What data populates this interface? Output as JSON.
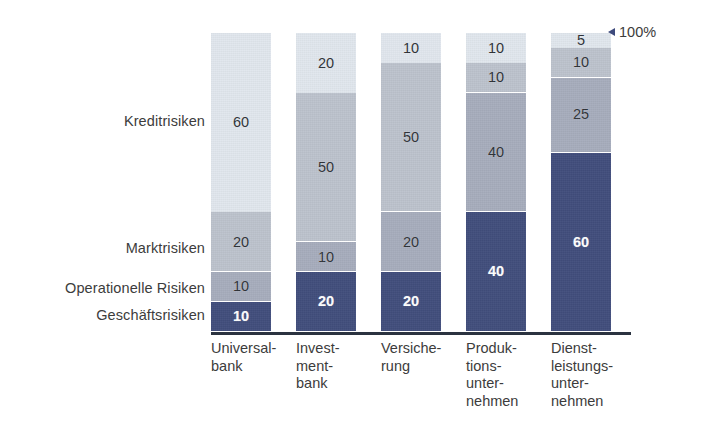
{
  "annotation": {
    "total_label": "100%",
    "arrow_icon": "triangle-left-icon"
  },
  "category_labels": [
    {
      "label": "Kreditrisiken",
      "top": 113
    },
    {
      "label": "Marktrisiken",
      "top": 240
    },
    {
      "label": "Operationelle Risiken",
      "top": 280
    },
    {
      "label": "Geschäftsrisiken",
      "top": 307
    }
  ],
  "x_labels": [
    {
      "label": "Universal-\nbank",
      "left": 0
    },
    {
      "label": "Invest-\nment-\nbank",
      "left": 85
    },
    {
      "label": "Versiche-\nrung",
      "left": 170
    },
    {
      "label": "Produk-\ntions-\nunter-\nnehmen",
      "left": 255
    },
    {
      "label": "Dienst-\nleistungs-\nunter-\nnehmen",
      "left": 340
    }
  ],
  "colors": {
    "geschaeftsrisiken": "#414e7c",
    "operationelle_risiken": "#a7adbd",
    "marktrisiken": "#bdc3cd",
    "kreditrisiken": "#e1e7ee",
    "axis": "#2b3340",
    "text": "#3c3c3c",
    "value_on_navy": "#ffffff",
    "background": "#ffffff"
  },
  "chart_data": {
    "type": "bar",
    "stacked": true,
    "normalized_total": 100,
    "title": "",
    "xlabel": "",
    "ylabel": "",
    "ylim": [
      0,
      100
    ],
    "grid": false,
    "legend_position": "left-inline-category-labels",
    "categories": [
      "Universal-\nbank",
      "Invest-\nment-\nbank",
      "Versiche-\nrung",
      "Produk-\ntions-\nunter-\nnehmen",
      "Dienst-\nleistungs-\nunter-\nnehmen"
    ],
    "series": [
      {
        "name": "Geschäftsrisiken",
        "color": "#414e7c",
        "values": [
          10,
          20,
          20,
          40,
          60
        ]
      },
      {
        "name": "Operationelle Risiken",
        "color": "#a7adbd",
        "values": [
          10,
          10,
          20,
          40,
          25
        ]
      },
      {
        "name": "Marktrisiken",
        "color": "#bdc3cd",
        "values": [
          20,
          50,
          50,
          10,
          10
        ]
      },
      {
        "name": "Kreditrisiken",
        "color": "#e1e7ee",
        "values": [
          60,
          20,
          10,
          10,
          5
        ]
      }
    ],
    "annotations": [
      "100%"
    ]
  }
}
